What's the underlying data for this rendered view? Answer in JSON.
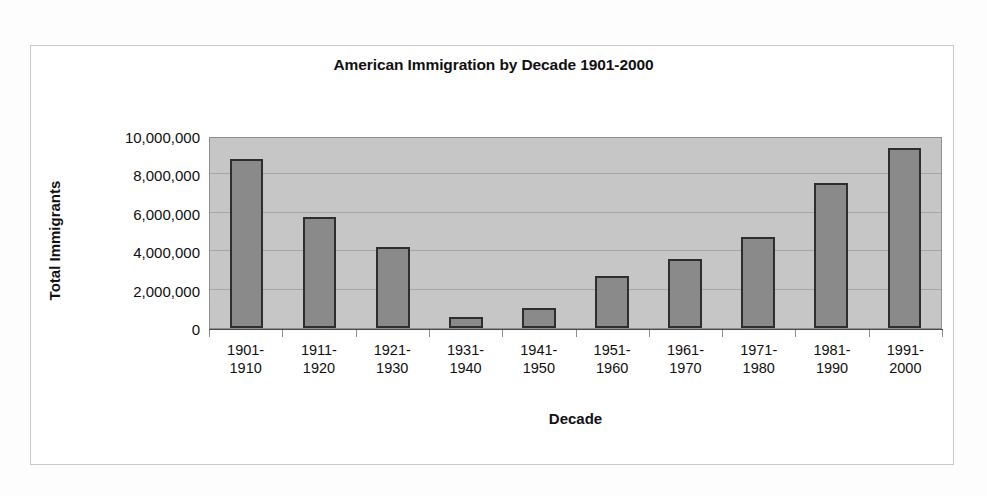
{
  "chart_data": {
    "type": "bar",
    "title": "American Immigration by Decade 1901-2000",
    "xlabel": "Decade",
    "ylabel": "Total Immigrants",
    "categories": [
      "1901-\n1910",
      "1911-\n1920",
      "1921-\n1930",
      "1931-\n1940",
      "1941-\n1950",
      "1951-\n1960",
      "1961-\n1970",
      "1971-\n1980",
      "1981-\n1990",
      "1991-\n2000"
    ],
    "values": [
      8800000,
      5800000,
      4200000,
      550000,
      1050000,
      2700000,
      3600000,
      4750000,
      7550000,
      9400000
    ],
    "ylim": [
      0,
      10000000
    ],
    "ytick_values": [
      0,
      2000000,
      4000000,
      6000000,
      8000000,
      10000000
    ],
    "ytick_labels": [
      "0",
      "2,000,000",
      "4,000,000",
      "6,000,000",
      "8,000,000",
      "10,000,000"
    ],
    "grid": true,
    "legend": false,
    "bar_color": "#8a8a8a",
    "bar_edge_color": "#2e2e2e",
    "plot_background": "#c6c6c6",
    "figure_background": "#ffffff"
  }
}
